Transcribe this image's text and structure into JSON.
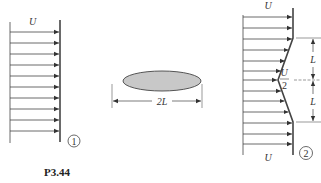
{
  "figure": {
    "caption": "P3.44",
    "colors": {
      "line": "#333333",
      "wall": "#444444",
      "ellipse_fill": "#c8c8c8"
    }
  },
  "profile1": {
    "velocity_label": "U",
    "station_label": "1",
    "arrow_count": 10,
    "shape": "uniform"
  },
  "body": {
    "shape": "ellipse",
    "dimension_label": "2L"
  },
  "profile2": {
    "top_velocity_label": "U",
    "bottom_velocity_label": "U",
    "center_velocity_numerator": "U",
    "center_velocity_denominator": "2",
    "station_label": "2",
    "upper_dim_label": "L",
    "lower_dim_label": "L",
    "arrow_count": 13,
    "shape": "uniform with triangular deficit"
  }
}
